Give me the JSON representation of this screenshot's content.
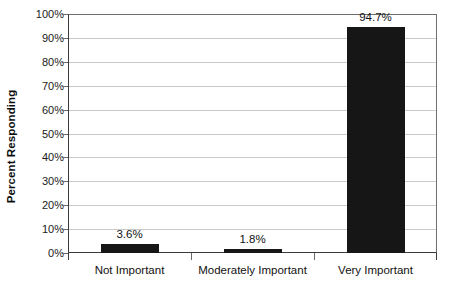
{
  "chart_data": {
    "type": "bar",
    "title": "",
    "xlabel": "",
    "ylabel": "Percent Responding",
    "categories": [
      "Not Important",
      "Moderately Important",
      "Very Important"
    ],
    "values": [
      3.6,
      1.8,
      94.7
    ],
    "data_labels": [
      "3.6%",
      "1.8%",
      "94.7%"
    ],
    "ylim": [
      0,
      100
    ],
    "ytick_values": [
      0,
      10,
      20,
      30,
      40,
      50,
      60,
      70,
      80,
      90,
      100
    ],
    "ytick_labels": [
      "0%",
      "10%",
      "20%",
      "30%",
      "40%",
      "50%",
      "60%",
      "70%",
      "80%",
      "90%",
      "100%"
    ],
    "grid": "horizontal",
    "legend": "none",
    "bar_color": "#161616",
    "gridline_color": "#c9c9c9",
    "axis_color": "#3a3a3a",
    "background_color": "#ffffff"
  }
}
